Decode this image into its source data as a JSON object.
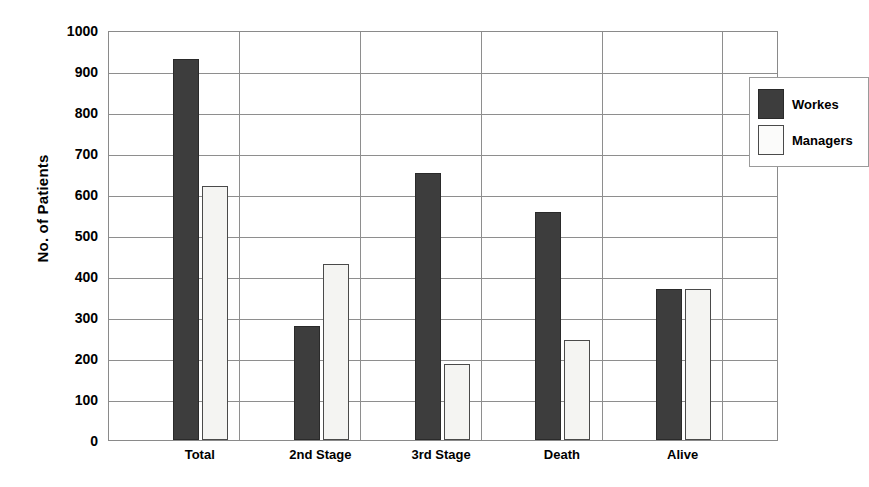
{
  "chart_data": {
    "type": "bar",
    "title": "",
    "xlabel": "",
    "ylabel": "No. of Patients",
    "categories": [
      "Total",
      "2nd Stage",
      "3rd Stage",
      "Death",
      "Alive"
    ],
    "series": [
      {
        "name": "Workes",
        "color": "#3d3d3d",
        "values": [
          930,
          278,
          650,
          555,
          368
        ]
      },
      {
        "name": "Managers",
        "color": "#f4f4f2",
        "values": [
          620,
          430,
          185,
          245,
          368
        ]
      }
    ],
    "ylim": [
      0,
      1000
    ],
    "yticks": [
      1000,
      900,
      800,
      700,
      600,
      500,
      400,
      300,
      200,
      100,
      0
    ],
    "grid": "horizontal-and-category-separators",
    "legend_position": "top-right-inside"
  },
  "legend": {
    "items": [
      {
        "label": "Workes",
        "swatch": "dark-swatch-icon"
      },
      {
        "label": "Managers",
        "swatch": "light-swatch-icon"
      }
    ]
  },
  "colors": {
    "workes_fill": "#3d3d3d",
    "managers_fill": "#f4f4f2",
    "grid": "#8e8e8e",
    "axis": "#8a8a8a",
    "background": "#ffffff",
    "text": "#000000"
  }
}
